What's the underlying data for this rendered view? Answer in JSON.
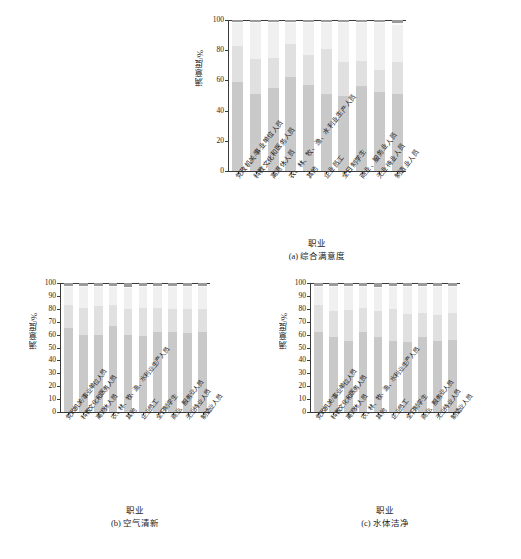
{
  "categories": [
    "党政机关/事业单位人员",
    "科教文化和医务人员",
    "离退休人员",
    "农、林、牧、渔、水利业生产人员",
    "其他",
    "企业员工",
    "全日制学生",
    "商业、服务业人员",
    "无业待业人员",
    "制造业人员"
  ],
  "axis": {
    "ylabel": "满意度/%",
    "xlabel": "职业",
    "yticks_a": [
      "0",
      "20",
      "40",
      "60",
      "80",
      "100"
    ],
    "yticks_bc": [
      "0",
      "10",
      "20",
      "30",
      "40",
      "50",
      "60",
      "70",
      "80",
      "90",
      "100"
    ],
    "ylim": [
      0,
      100
    ]
  },
  "captions": {
    "a": "(a) 综合满意度",
    "b": "(b) 空气清新",
    "c": "(c) 水体洁净"
  },
  "colors": {
    "seg1": "#c9c9c9",
    "seg2": "#e0e0e0",
    "seg3": "#f0f0f0",
    "seg4": "#fafafa",
    "seg5": "#9a9a9a",
    "axis": "#3a3a3a",
    "background": "#ffffff"
  },
  "chart_data": [
    {
      "type": "bar",
      "id": "a",
      "title": "(a) 综合满意度",
      "xlabel": "职业",
      "ylabel": "满意度/%",
      "ylim": [
        0,
        100
      ],
      "grid": false,
      "legend": "none",
      "stacked": true,
      "categories": [
        "党政机关/事业单位人员",
        "科教文化和医务人员",
        "离退休人员",
        "农、林、牧、渔、水利业生产人员",
        "其他",
        "企业员工",
        "全日制学生",
        "商业、服务业人员",
        "无业待业人员",
        "制造业人员"
      ],
      "series": [
        {
          "name": "很满意",
          "values": [
            59,
            51,
            55,
            62,
            57,
            51,
            50,
            56,
            52,
            51
          ]
        },
        {
          "name": "比较满意",
          "values": [
            24,
            23,
            20,
            22,
            20,
            30,
            22,
            17,
            15,
            21
          ]
        },
        {
          "name": "一般",
          "values": [
            15,
            24,
            23,
            14,
            21,
            17,
            26,
            25,
            31,
            25
          ]
        },
        {
          "name": "不太满意",
          "values": [
            1,
            1,
            1,
            1,
            1,
            1,
            1,
            1,
            1,
            1
          ]
        },
        {
          "name": "很不满意",
          "values": [
            1,
            1,
            1,
            1,
            1,
            1,
            1,
            1,
            1,
            2
          ]
        }
      ]
    },
    {
      "type": "bar",
      "id": "b",
      "title": "(b) 空气清新",
      "xlabel": "职业",
      "ylabel": "满意度/%",
      "ylim": [
        0,
        100
      ],
      "grid": false,
      "legend": "none",
      "stacked": true,
      "categories": [
        "党政机关/事业单位人员",
        "科教文化和医务人员",
        "离退休人员",
        "农、林、牧、渔、水利业生产人员",
        "其他",
        "企业员工",
        "全日制学生",
        "商业、服务业人员",
        "无业待业人员",
        "制造业人员"
      ],
      "series": [
        {
          "name": "很满意",
          "values": [
            65,
            60,
            60,
            67,
            60,
            59,
            62,
            62,
            61,
            62
          ]
        },
        {
          "name": "比较满意",
          "values": [
            18,
            21,
            22,
            16,
            20,
            22,
            19,
            18,
            19,
            18
          ]
        },
        {
          "name": "一般",
          "values": [
            14,
            16,
            15,
            14,
            16,
            16,
            16,
            17,
            17,
            17
          ]
        },
        {
          "name": "不太满意",
          "values": [
            1,
            1,
            1,
            1,
            1,
            1,
            1,
            1,
            1,
            1
          ]
        },
        {
          "name": "很不满意",
          "values": [
            2,
            2,
            2,
            2,
            3,
            2,
            2,
            2,
            2,
            2
          ]
        }
      ]
    },
    {
      "type": "bar",
      "id": "c",
      "title": "(c) 水体洁净",
      "xlabel": "职业",
      "ylabel": "满意度/%",
      "ylim": [
        0,
        100
      ],
      "grid": false,
      "legend": "none",
      "stacked": true,
      "categories": [
        "党政机关/事业单位人员",
        "科教文化和医务人员",
        "离退休人员",
        "农、林、牧、渔、水利业生产人员",
        "其他",
        "企业员工",
        "全日制学生",
        "商业、服务业人员",
        "无业待业人员",
        "制造业人员"
      ],
      "series": [
        {
          "name": "很满意",
          "values": [
            62,
            58,
            55,
            62,
            58,
            55,
            54,
            58,
            55,
            56
          ]
        },
        {
          "name": "比较满意",
          "values": [
            21,
            20,
            24,
            19,
            20,
            25,
            22,
            19,
            20,
            21
          ]
        },
        {
          "name": "一般",
          "values": [
            14,
            19,
            18,
            16,
            18,
            17,
            21,
            20,
            22,
            20
          ]
        },
        {
          "name": "不太满意",
          "values": [
            1,
            1,
            1,
            1,
            1,
            1,
            1,
            1,
            1,
            1
          ]
        },
        {
          "name": "很不满意",
          "values": [
            2,
            2,
            2,
            2,
            3,
            2,
            2,
            2,
            2,
            2
          ]
        }
      ]
    }
  ]
}
